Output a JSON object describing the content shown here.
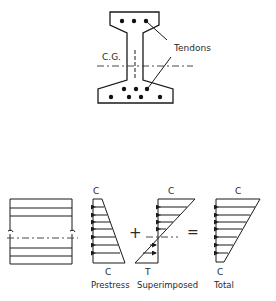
{
  "cross_section": {
    "cg_label": "C.G.",
    "tendons_label": "Tendons",
    "top_tendons": [
      [
        122,
        21
      ],
      [
        134,
        21
      ],
      [
        146,
        21
      ]
    ],
    "bottom_tendons": [
      [
        124,
        89
      ],
      [
        136,
        89
      ],
      [
        147,
        89
      ],
      [
        111,
        97
      ],
      [
        129,
        97
      ],
      [
        141,
        97
      ],
      [
        160,
        97
      ]
    ]
  },
  "stress_diagrams": {
    "operators": {
      "plus": "+",
      "equals": "="
    },
    "prestress": {
      "top_label": "C",
      "bottom_label": "C",
      "caption": "Prestress"
    },
    "superimposed": {
      "top_label": "C",
      "bottom_label": "T",
      "caption": "Superimposed"
    },
    "total": {
      "top_label": "C",
      "bottom_label": "C",
      "caption": "Total"
    }
  }
}
